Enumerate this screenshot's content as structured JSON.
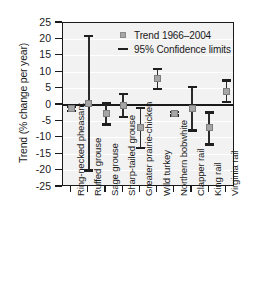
{
  "chart_data": {
    "type": "scatter",
    "title": "",
    "xlabel": "",
    "ylabel": "Trend (% change per year)",
    "ylim": [
      -25,
      25
    ],
    "ytick_labels": [
      "25",
      "20",
      "15",
      "10",
      "5",
      "0",
      "-5",
      "-10",
      "-15",
      "-20",
      "-25"
    ],
    "ytick_values": [
      25,
      20,
      15,
      10,
      5,
      0,
      -5,
      -10,
      -15,
      -20,
      -25
    ],
    "grid": true,
    "legend_position": "top-right",
    "legend": [
      {
        "label": "Trend 1966–2004",
        "marker": "square",
        "color": "#a6a6a6"
      },
      {
        "label": "95% Confidence limits",
        "marker": "line",
        "color": "#1f1f1f"
      }
    ],
    "categories": [
      "Ring-necked pheasant",
      "Ruffed grouse",
      "Sage grouse",
      "Sharp-tailed grouse",
      "Greater prairie-chicken",
      "Wild turkey",
      "Northern bobwhite",
      "Clapper rail",
      "King rail",
      "Virginia rail"
    ],
    "values": [
      -1.0,
      0.5,
      -2.5,
      -0.2,
      -7.0,
      8.0,
      -2.6,
      -1.0,
      -7.0,
      4.2
    ],
    "ci_lower": [
      -1.8,
      -20.0,
      -6.0,
      -3.7,
      -13.2,
      4.8,
      -3.2,
      -7.8,
      -12.0,
      1.0
    ],
    "ci_upper": [
      -0.4,
      21.0,
      0.5,
      3.3,
      -1.0,
      11.0,
      -2.1,
      5.5,
      -2.3,
      7.5
    ],
    "points": [
      {
        "category": "Ring-necked pheasant",
        "trend": -1.0,
        "ci_lower": -1.8,
        "ci_upper": -0.4
      },
      {
        "category": "Ruffed grouse",
        "trend": 0.5,
        "ci_lower": -20.0,
        "ci_upper": 21.0
      },
      {
        "category": "Sage grouse",
        "trend": -2.5,
        "ci_lower": -6.0,
        "ci_upper": 0.5
      },
      {
        "category": "Sharp-tailed grouse",
        "trend": -0.2,
        "ci_lower": -3.7,
        "ci_upper": 3.3
      },
      {
        "category": "Greater prairie-chicken",
        "trend": -7.0,
        "ci_lower": -13.2,
        "ci_upper": -1.0
      },
      {
        "category": "Wild turkey",
        "trend": 8.0,
        "ci_lower": 4.8,
        "ci_upper": 11.0
      },
      {
        "category": "Northern bobwhite",
        "trend": -2.6,
        "ci_lower": -3.2,
        "ci_upper": -2.1
      },
      {
        "category": "Clapper rail",
        "trend": -1.0,
        "ci_lower": -7.8,
        "ci_upper": 5.5
      },
      {
        "category": "King rail",
        "trend": -7.0,
        "ci_lower": -12.0,
        "ci_upper": -2.3
      },
      {
        "category": "Virginia rail",
        "trend": 4.2,
        "ci_lower": 1.0,
        "ci_upper": 7.5
      }
    ]
  }
}
